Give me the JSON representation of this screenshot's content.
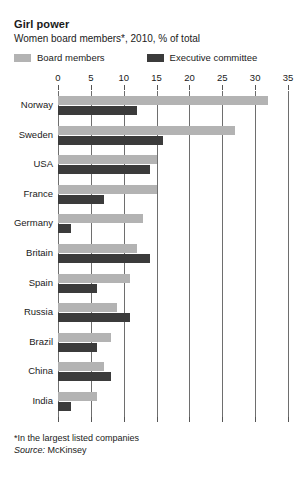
{
  "header": {
    "title": "Girl power",
    "subtitle": "Women board members*, 2010, % of total"
  },
  "legend": {
    "items": [
      {
        "label": "Board members",
        "color": "#b3b3b3",
        "swatch_name": "legend-swatch-board-members"
      },
      {
        "label": "Executive committee",
        "color": "#3b3b3b",
        "swatch_name": "legend-swatch-executive-committee"
      }
    ]
  },
  "footnotes": {
    "note": "*In the largest listed companies",
    "source_word": "Source:",
    "source_name": "McKinsey"
  },
  "chart_data": {
    "type": "bar",
    "orientation": "horizontal",
    "title": "Girl power",
    "subtitle": "Women board members*, 2010, % of total",
    "xlabel": "",
    "ylabel": "",
    "xlim": [
      0,
      35
    ],
    "xticks": [
      0,
      5,
      10,
      15,
      20,
      25,
      30,
      35
    ],
    "xtick_labels": [
      "0",
      "5",
      "10",
      "15",
      "20",
      "25",
      "30",
      "35"
    ],
    "grid": true,
    "legend_position": "top",
    "categories": [
      "Norway",
      "Sweden",
      "USA",
      "France",
      "Germany",
      "Britain",
      "Spain",
      "Russia",
      "Brazil",
      "China",
      "India"
    ],
    "series": [
      {
        "name": "Board members",
        "color": "#b3b3b3",
        "values": [
          32,
          27,
          15,
          15,
          13,
          12,
          11,
          9,
          8,
          7,
          6
        ]
      },
      {
        "name": "Executive committee",
        "color": "#3b3b3b",
        "values": [
          12,
          16,
          14,
          7,
          2,
          14,
          6,
          11,
          6,
          8,
          2
        ]
      }
    ]
  }
}
